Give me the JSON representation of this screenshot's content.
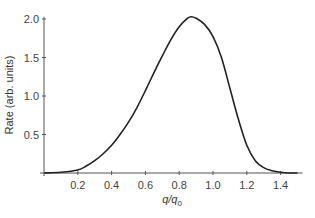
{
  "chart_data": {
    "type": "line",
    "title": "",
    "xlabel": "q/q0",
    "xlabel_main": "q/q",
    "xlabel_sub": "0",
    "ylabel": "Rate (arb. units)",
    "xlim": [
      0,
      1.53
    ],
    "ylim": [
      0,
      2.1
    ],
    "xticks": [
      0.2,
      0.4,
      0.6,
      0.8,
      1.0,
      1.2,
      1.4
    ],
    "xtick_labels": [
      "0.2",
      "0.4",
      "0.6",
      "0.8",
      "1.0",
      "1.2",
      "1.4"
    ],
    "yticks": [
      0.5,
      1.0,
      1.5,
      2.0
    ],
    "ytick_labels": [
      "0.5",
      "1.0",
      "1.5",
      "2.0"
    ],
    "grid": false,
    "legend": null,
    "series": [
      {
        "name": "Rate",
        "color": "#222222",
        "x": [
          0.0,
          0.1,
          0.2,
          0.25,
          0.3,
          0.35,
          0.4,
          0.45,
          0.5,
          0.55,
          0.6,
          0.65,
          0.7,
          0.75,
          0.8,
          0.85,
          0.87,
          0.9,
          0.95,
          1.0,
          1.05,
          1.1,
          1.15,
          1.2,
          1.25,
          1.3,
          1.35,
          1.4,
          1.45,
          1.5
        ],
        "y": [
          0.0,
          0.01,
          0.04,
          0.09,
          0.16,
          0.25,
          0.36,
          0.5,
          0.66,
          0.85,
          1.07,
          1.3,
          1.52,
          1.73,
          1.9,
          2.01,
          2.03,
          2.01,
          1.93,
          1.77,
          1.5,
          1.1,
          0.7,
          0.36,
          0.16,
          0.07,
          0.03,
          0.01,
          0.0,
          0.0
        ]
      }
    ]
  }
}
